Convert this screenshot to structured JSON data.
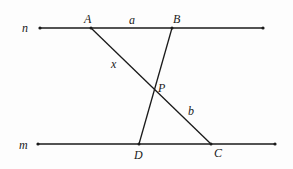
{
  "diagram": {
    "lines": {
      "n": {
        "label": "n",
        "x1": 40,
        "y1": 28,
        "x2": 263,
        "y2": 28
      },
      "m": {
        "label": "m",
        "x1": 38,
        "y1": 144,
        "x2": 275,
        "y2": 144
      },
      "AC": {
        "x1": 91,
        "y1": 28,
        "x2": 211,
        "y2": 144
      },
      "BD": {
        "x1": 172,
        "y1": 28,
        "x2": 139,
        "y2": 144
      }
    },
    "points": {
      "A": {
        "label": "A",
        "x": 91,
        "y": 28
      },
      "B": {
        "label": "B",
        "x": 172,
        "y": 28
      },
      "P": {
        "label": "P",
        "x": 154,
        "y": 93
      },
      "C": {
        "label": "C",
        "x": 211,
        "y": 144
      },
      "D": {
        "label": "D",
        "x": 139,
        "y": 144
      }
    },
    "segment_labels": {
      "a": {
        "label": "a",
        "segment": "AB"
      },
      "x": {
        "label": "x",
        "segment": "AP"
      },
      "b": {
        "label": "b",
        "segment": "PC"
      }
    },
    "colors": {
      "stroke": "#1a1a1a",
      "background": "#fdfdfd"
    }
  }
}
